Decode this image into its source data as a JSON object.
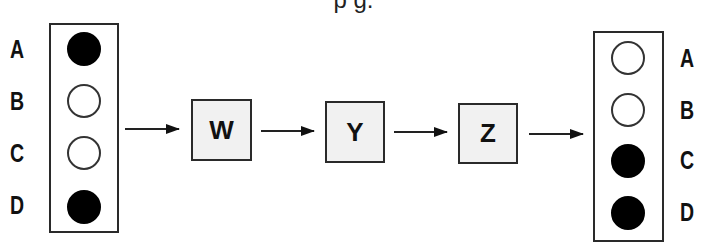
{
  "title_fragment": "p                       g.",
  "input_panel": {
    "labels": [
      "A",
      "B",
      "C",
      "D"
    ],
    "states": [
      "filled",
      "empty",
      "empty",
      "filled"
    ]
  },
  "stages": [
    {
      "label": "W"
    },
    {
      "label": "Y"
    },
    {
      "label": "Z"
    }
  ],
  "output_panel": {
    "labels": [
      "A",
      "B",
      "C",
      "D"
    ],
    "states": [
      "empty",
      "empty",
      "filled",
      "filled"
    ]
  },
  "colors": {
    "filled": "#000000",
    "empty": "#ffffff",
    "stage_fill": "#f1f1f1",
    "stroke": "#2a2a2a"
  }
}
